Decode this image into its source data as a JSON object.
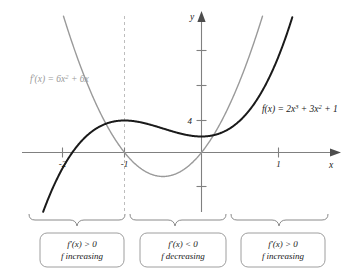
{
  "chart_data": {
    "type": "line",
    "title": "",
    "xlabel": "x",
    "ylabel": "y",
    "xlim": [
      -2.45,
      1.62
    ],
    "ylim": [
      -4.2,
      11.0
    ],
    "grid": false,
    "legend": "inline-curve-labels",
    "x_ticks": [
      -2,
      -1,
      1
    ],
    "x_tick_labels": [
      "-2",
      "-1",
      "1"
    ],
    "y_ticks": [
      -2,
      2,
      4,
      6,
      8
    ],
    "y_tick_labels": [
      "",
      "",
      "4",
      "",
      ""
    ],
    "series": [
      {
        "name": "f(x) = 2x^3 + 3x^2 + 1",
        "label_plain": "f(x) = 2x",
        "color": "#1a1a1a",
        "style": "solid",
        "width": 2.0,
        "expression": "2*x^3 + 3*x^2 + 1",
        "coefficients": {
          "a": 2,
          "b": 3,
          "c": 0,
          "d": 1
        },
        "key_points": [
          {
            "x": -1,
            "y": 2,
            "kind": "local maximum"
          },
          {
            "x": 0,
            "y": 1,
            "kind": "local minimum"
          },
          {
            "x": -1.6514,
            "y": 0,
            "kind": "x-intercept"
          }
        ]
      },
      {
        "name": "f'(x) = 6x^2 + 6x",
        "color": "#9a9a9a",
        "style": "solid",
        "width": 1.4,
        "expression": "6*x^2 + 6*x",
        "coefficients": {
          "a": 6,
          "b": 6,
          "c": 0
        },
        "key_points": [
          {
            "x": -1,
            "y": 0,
            "kind": "root"
          },
          {
            "x": 0,
            "y": 0,
            "kind": "root"
          },
          {
            "x": -0.5,
            "y": -1.5,
            "kind": "vertex"
          }
        ]
      }
    ],
    "annotations": {
      "dashed_vertical_x": -1,
      "intervals": [
        {
          "range": "(-inf, -1)",
          "sign": "positive"
        },
        {
          "range": "(-1, 0)",
          "sign": "negative"
        },
        {
          "range": "(0, inf)",
          "sign": "positive"
        }
      ]
    }
  },
  "labels": {
    "derivative_curve": {
      "fn": "f",
      "prime": "′",
      "arg": "(x) = 6x",
      "exp": "2",
      "tail": " + 6x"
    },
    "function_curve": {
      "head": "f(x) = 2x",
      "exp1": "3",
      "mid": " + 3x",
      "exp2": "2",
      "tail": " + 1"
    },
    "axis_x": "x",
    "axis_y": "y",
    "tick_x_neg2": "-2",
    "tick_x_neg1": "-1",
    "tick_x_pos1": "1",
    "tick_y_4": "4"
  },
  "interval_boxes": [
    {
      "id": "left",
      "line1_fn": "f",
      "line1_prime": "′",
      "line1_rest": "(x) > 0",
      "line2_fn": "f",
      "line2_rest": "increasing"
    },
    {
      "id": "middle",
      "line1_fn": "f",
      "line1_prime": "′",
      "line1_rest": "(x) < 0",
      "line2_fn": "f",
      "line2_rest": "decreasing"
    },
    {
      "id": "right",
      "line1_fn": "f",
      "line1_prime": "′",
      "line1_rest": "(x) > 0",
      "line2_fn": "f",
      "line2_rest": "increasing"
    }
  ],
  "colors": {
    "curve_function": "#1a1a1a",
    "curve_derivative": "#9a9a9a",
    "axis": "#808080",
    "dashed_guide": "#bdbdbd",
    "brace": "#8a8a8a",
    "box_border": "#9e9e9e",
    "background": "#ffffff"
  }
}
